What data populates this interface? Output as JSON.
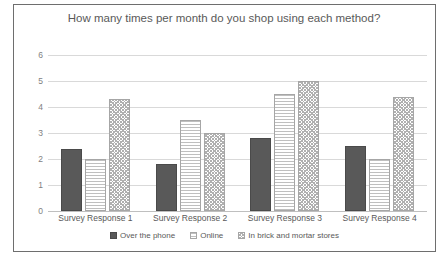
{
  "background_text": {
    "lines": [
      "right",
      "Shopping ever differs",
      "are some of the benefits",
      "and there are many options to shop from",
      "each method of shopping has advantages"
    ]
  },
  "chart_data": {
    "type": "bar",
    "title": "How many times per month do you shop using each method?",
    "xlabel": "",
    "ylabel": "",
    "ylim": [
      0,
      6
    ],
    "yticks": [
      0,
      1,
      2,
      3,
      4,
      5,
      6
    ],
    "grid": true,
    "legend_position": "bottom",
    "categories": [
      "Survey Response 1",
      "Survey Response 2",
      "Survey Response 3",
      "Survey Response 4"
    ],
    "series": [
      {
        "name": "Over the phone",
        "values": [
          2.4,
          1.8,
          2.8,
          2.5
        ],
        "color": "#595959",
        "pattern": "solid"
      },
      {
        "name": "Online",
        "values": [
          2.0,
          3.5,
          4.5,
          2.0
        ],
        "color": "#ffffff",
        "pattern": "horizontal-lines"
      },
      {
        "name": "In brick and mortar stores",
        "values": [
          4.3,
          3.0,
          5.0,
          4.4
        ],
        "color": "#ffffff",
        "pattern": "checkerboard"
      }
    ]
  },
  "colors": {
    "frame_border": "#6e6e6e",
    "gridline": "#d9d9d9",
    "axis_text": "#7f7f7f",
    "title_text": "#595959"
  }
}
